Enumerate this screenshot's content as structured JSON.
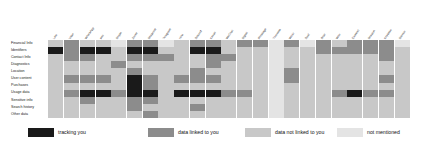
{
  "chart_data": {
    "type": "heatmap",
    "title": "",
    "xlabel": "",
    "ylabel": "",
    "grid": false,
    "legend_position": "bottom",
    "categories_y": [
      "Financial Info",
      "Identifiers",
      "Contact Info",
      "Diagnostics",
      "Location",
      "User content",
      "Purchases",
      "Usage data",
      "Sensitive info",
      "Search history",
      "Other data"
    ],
    "categories_x": [
      "Line",
      "Viber",
      "WhatsApp",
      "imo",
      "Skype",
      "Zoom",
      "Snapchat",
      "Telegram",
      "Hike",
      "Discord",
      "Kakao",
      "WeChat",
      "Signal",
      "iMessage",
      "Threema",
      "Wickr",
      "Dust",
      "Briar",
      "Wire",
      "Element",
      "Session",
      "Keybase",
      "Silence"
    ],
    "value_labels": [
      "tracking you",
      "data linked to you",
      "data not linked to you",
      "not mentioned"
    ],
    "value_colors": [
      "#1a1a1a",
      "#8c8c8c",
      "#c8c8c8",
      "#e4e4e4"
    ],
    "values": [
      [
        2,
        1,
        2,
        2,
        3,
        1,
        1,
        3,
        2,
        1,
        1,
        2,
        1,
        1,
        3,
        1,
        3,
        1,
        2,
        1,
        1,
        1,
        3
      ],
      [
        0,
        1,
        0,
        0,
        2,
        0,
        0,
        2,
        2,
        0,
        0,
        2,
        2,
        2,
        3,
        2,
        2,
        1,
        1,
        1,
        1,
        1,
        2
      ],
      [
        2,
        1,
        1,
        2,
        2,
        1,
        1,
        1,
        2,
        2,
        1,
        1,
        2,
        2,
        3,
        2,
        2,
        2,
        2,
        2,
        2,
        1,
        2
      ],
      [
        2,
        2,
        2,
        2,
        1,
        2,
        2,
        2,
        2,
        2,
        1,
        2,
        2,
        2,
        3,
        2,
        2,
        2,
        2,
        2,
        2,
        2,
        2
      ],
      [
        2,
        2,
        2,
        2,
        2,
        1,
        2,
        2,
        2,
        1,
        2,
        2,
        2,
        2,
        3,
        1,
        2,
        2,
        2,
        2,
        2,
        2,
        2
      ],
      [
        2,
        1,
        1,
        1,
        2,
        0,
        1,
        2,
        1,
        1,
        1,
        2,
        2,
        2,
        3,
        1,
        2,
        2,
        2,
        2,
        2,
        1,
        2
      ],
      [
        2,
        2,
        2,
        2,
        2,
        0,
        1,
        2,
        2,
        2,
        2,
        2,
        2,
        2,
        3,
        2,
        2,
        2,
        2,
        2,
        2,
        2,
        2
      ],
      [
        2,
        1,
        0,
        0,
        1,
        0,
        0,
        2,
        0,
        0,
        0,
        1,
        1,
        2,
        3,
        2,
        2,
        2,
        1,
        0,
        1,
        1,
        2
      ],
      [
        2,
        2,
        1,
        2,
        2,
        1,
        1,
        2,
        2,
        2,
        2,
        2,
        2,
        2,
        3,
        2,
        2,
        2,
        2,
        2,
        2,
        2,
        2
      ],
      [
        2,
        2,
        2,
        2,
        2,
        1,
        2,
        2,
        2,
        1,
        2,
        2,
        2,
        2,
        3,
        2,
        2,
        2,
        2,
        2,
        2,
        2,
        2
      ],
      [
        2,
        2,
        2,
        2,
        2,
        2,
        1,
        2,
        2,
        2,
        2,
        2,
        2,
        2,
        3,
        2,
        2,
        2,
        2,
        2,
        2,
        2,
        2
      ]
    ]
  },
  "legend": {
    "items": [
      {
        "label": "tracking you",
        "color": "#1a1a1a"
      },
      {
        "label": "data linked to you",
        "color": "#8c8c8c"
      },
      {
        "label": "data not linked to you",
        "color": "#c8c8c8"
      },
      {
        "label": "not mentioned",
        "color": "#e4e4e4"
      }
    ]
  }
}
